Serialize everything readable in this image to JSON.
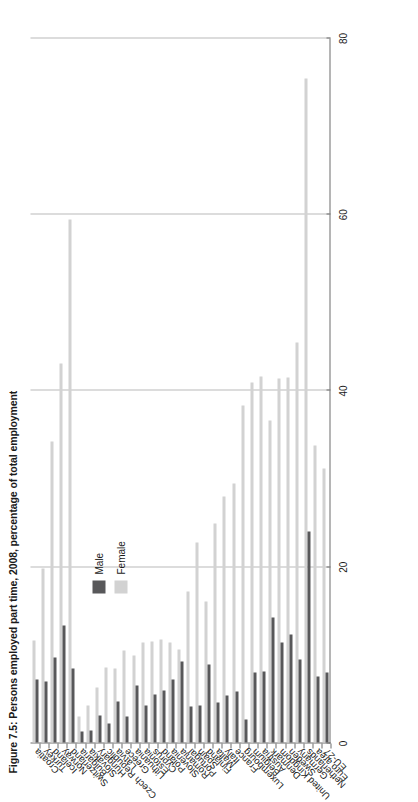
{
  "figure": {
    "title": "Figure 7.5: Persons employed part time, 2008, percentage of total employment"
  },
  "legend": {
    "position": "inside-upper-left",
    "items": [
      {
        "label": "Male",
        "color": "#58585a"
      },
      {
        "label": "Female",
        "color": "#d2d2d2"
      }
    ]
  },
  "axis": {
    "tick_labels": [
      "0",
      "20",
      "40",
      "60",
      "80"
    ]
  },
  "chart_data": {
    "type": "bar",
    "orientation": "vertical-categories-rotated",
    "title": "Figure 7.5: Persons employed part time, 2008, percentage of total employment",
    "xlabel": "",
    "ylabel": "percentage of total employment",
    "ylim": [
      0,
      80
    ],
    "ticks": [
      0,
      20,
      40,
      60,
      80
    ],
    "grid": true,
    "legend": [
      "Male",
      "Female"
    ],
    "categories": [
      "EU-27",
      "Euro area",
      "Netherlands",
      "Germany",
      "Sweden",
      "United Kingdom",
      "Denmark",
      "Austria",
      "Belgium",
      "Luxembourg",
      "France",
      "Italy",
      "Malta",
      "Finland",
      "Spain",
      "Portugal",
      "Romania",
      "Slovenia",
      "Poland",
      "Cyprus",
      "Estonia",
      "Lithuania",
      "Greece",
      "Latvia",
      "Czech Republic",
      "Hungary",
      "Slovakia",
      "Bulgaria",
      "Switzerland",
      "Norway",
      "Iceland",
      "Turkey",
      "Croatia"
    ],
    "series": [
      {
        "name": "Male",
        "color": "#58585a",
        "values": [
          7.9,
          7.5,
          23.9,
          9.4,
          12.3,
          11.3,
          14.2,
          8.1,
          7.9,
          2.6,
          5.8,
          5.3,
          4.5,
          8.9,
          4.2,
          4.1,
          9.2,
          7.2,
          5.9,
          5.4,
          4.2,
          6.5,
          3.0,
          4.6,
          2.2,
          3.1,
          1.4,
          1.3,
          8.4,
          13.3,
          9.6,
          6.9,
          7.2
        ]
      },
      {
        "name": "Female",
        "color": "#d2d2d2",
        "values": [
          31.1,
          33.7,
          75.3,
          45.4,
          41.4,
          41.3,
          36.5,
          41.5,
          40.8,
          38.2,
          29.4,
          27.9,
          24.8,
          16.0,
          22.7,
          17.1,
          10.5,
          11.4,
          11.7,
          11.5,
          11.4,
          9.9,
          10.4,
          8.4,
          8.5,
          6.2,
          4.2,
          3.0,
          59.3,
          43.0,
          34.2,
          19.8,
          11.6
        ]
      }
    ]
  }
}
